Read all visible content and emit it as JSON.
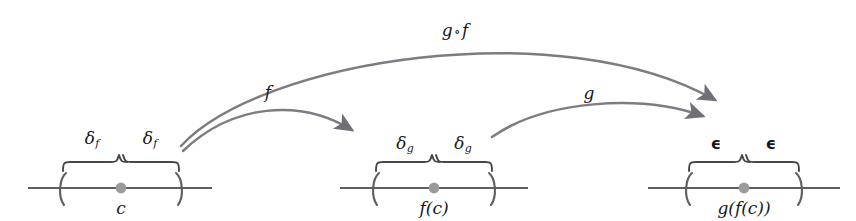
{
  "figure": {
    "background_color": "#ffffff",
    "ink_color": "#5d5d63",
    "text_color": "#17171a",
    "dot_color": "#9a9a9a"
  },
  "arcs": [
    {
      "id": "arc-composition",
      "label": "g",
      "ring": "∘",
      "label2": "f",
      "full_label": "g ∘ f",
      "from": "c-interval",
      "to": "gfc-interval"
    },
    {
      "id": "arc-f",
      "label": "f",
      "from": "c-interval",
      "to": "fc-interval"
    },
    {
      "id": "arc-g",
      "label": "g",
      "from": "fc-interval",
      "to": "gfc-interval"
    }
  ],
  "intervals": [
    {
      "id": "c-interval",
      "center_label": "c",
      "left_brace_label": "δ",
      "left_brace_sub": "f",
      "right_brace_label": "δ",
      "right_brace_sub": "f",
      "open_paren": "(",
      "close_paren": ")"
    },
    {
      "id": "fc-interval",
      "center_label": "f(c)",
      "left_brace_label": "δ",
      "left_brace_sub": "g",
      "right_brace_label": "δ",
      "right_brace_sub": "g",
      "open_paren": "(",
      "close_paren": ")"
    },
    {
      "id": "gfc-interval",
      "center_label": "g(f(c))",
      "left_brace_label": "ϵ",
      "left_brace_sub": "",
      "right_brace_label": "ϵ",
      "right_brace_sub": "",
      "open_paren": "(",
      "close_paren": ")"
    }
  ]
}
